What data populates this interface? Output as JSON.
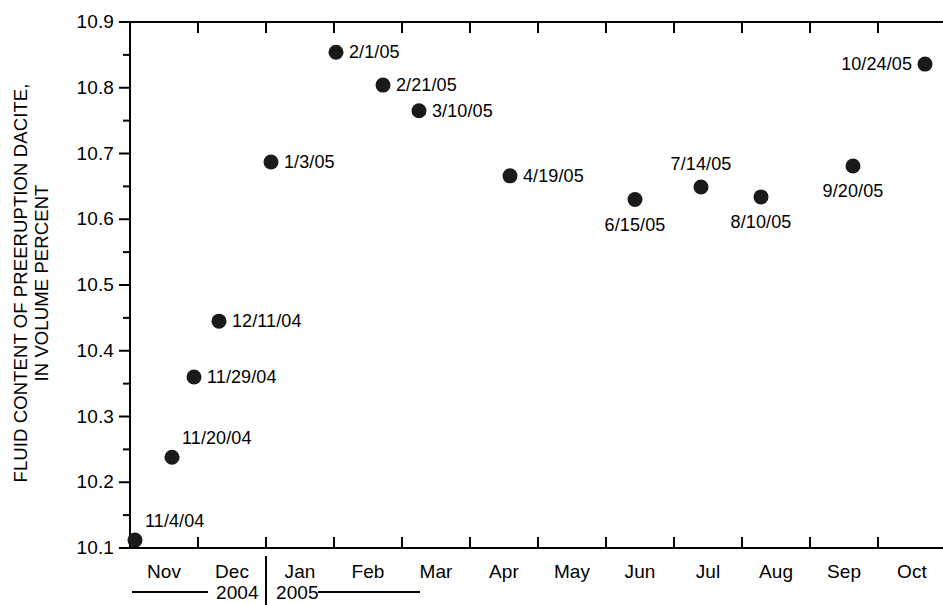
{
  "chart_data": {
    "type": "scatter",
    "title": "",
    "subtitle": "",
    "xlabel": "",
    "ylabel": "FLUID CONTENT OF PREERUPTION DACITE,\nIN VOLUME PERCENT",
    "ylim": [
      10.1,
      10.9
    ],
    "ytick_labels": [
      "10.9",
      "10.8",
      "10.7",
      "10.6",
      "10.5",
      "10.4",
      "10.3",
      "10.2",
      "10.1"
    ],
    "ytick_values": [
      10.9,
      10.8,
      10.7,
      10.6,
      10.5,
      10.4,
      10.3,
      10.2,
      10.1
    ],
    "yminor_values": [
      10.85,
      10.75,
      10.65,
      10.55,
      10.45,
      10.35,
      10.25,
      10.15
    ],
    "xtick_labels": [
      "Nov",
      "Dec",
      "Jan",
      "Feb",
      "Mar",
      "Apr",
      "May",
      "Jun",
      "Jul",
      "Aug",
      "Sep",
      "Oct"
    ],
    "xminor_step_label": "month",
    "grid": false,
    "legend": "none",
    "marker": "filled-circle",
    "marker_color": "#1a1a1a",
    "axis_color": "#000000",
    "year_groups": [
      {
        "label": "2004",
        "rule": "left"
      },
      {
        "label": "2005",
        "rule": "right"
      }
    ],
    "points": [
      {
        "label": "11/4/04",
        "x_month": "Nov",
        "x": 135,
        "value": 10.112,
        "label_pos": "above-right"
      },
      {
        "label": "11/20/04",
        "x_month": "Nov",
        "x": 172,
        "value": 10.238,
        "label_pos": "above-right"
      },
      {
        "label": "11/29/04",
        "x_month": "Nov",
        "x": 194,
        "value": 10.36,
        "label_pos": "right"
      },
      {
        "label": "12/11/04",
        "x_month": "Dec",
        "x": 219,
        "value": 10.445,
        "label_pos": "right"
      },
      {
        "label": "1/3/05",
        "x_month": "Jan",
        "x": 271,
        "value": 10.687,
        "label_pos": "right"
      },
      {
        "label": "2/1/05",
        "x_month": "Feb",
        "x": 336,
        "value": 10.854,
        "label_pos": "right"
      },
      {
        "label": "2/21/05",
        "x_month": "Feb",
        "x": 383,
        "value": 10.804,
        "label_pos": "right"
      },
      {
        "label": "3/10/05",
        "x_month": "Mar",
        "x": 419,
        "value": 10.765,
        "label_pos": "right"
      },
      {
        "label": "4/19/05",
        "x_month": "Apr",
        "x": 510,
        "value": 10.666,
        "label_pos": "right"
      },
      {
        "label": "6/15/05",
        "x_month": "Jun",
        "x": 635,
        "value": 10.63,
        "label_pos": "below"
      },
      {
        "label": "7/14/05",
        "x_month": "Jul",
        "x": 701,
        "value": 10.649,
        "label_pos": "above"
      },
      {
        "label": "8/10/05",
        "x_month": "Aug",
        "x": 761,
        "value": 10.634,
        "label_pos": "below"
      },
      {
        "label": "9/20/05",
        "x_month": "Sep",
        "x": 853,
        "value": 10.681,
        "label_pos": "below"
      },
      {
        "label": "10/24/05",
        "x_month": "Oct",
        "x": 925,
        "value": 10.836,
        "label_pos": "left"
      }
    ]
  }
}
